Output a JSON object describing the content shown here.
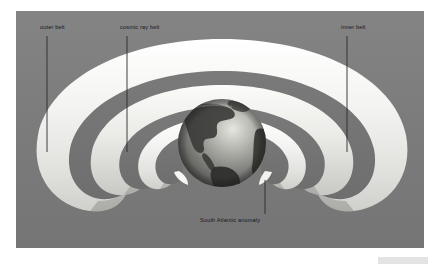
{
  "figure": {
    "type": "scientific-illustration",
    "style": "grayscale cross-section diagram",
    "background_color": "#7d7d7d",
    "page_color": "#ffffff",
    "frame": {
      "x": 16,
      "y": 11,
      "width": 408,
      "height": 237
    }
  },
  "labels": {
    "outer_belt": "outer belt",
    "cosmic_ray_belt": "cosmic ray belt",
    "inner_belt": "inner belt",
    "south_atlantic_anomaly": "South Atlantic anomaly"
  },
  "leader_lines": [
    {
      "name": "outer-belt-leader",
      "x": 47,
      "y_start": 36,
      "y_end": 152
    },
    {
      "name": "cosmic-ray-leader",
      "x": 127,
      "y_start": 36,
      "y_end": 152
    },
    {
      "name": "inner-belt-leader",
      "x": 347,
      "y_start": 36,
      "y_end": 152
    },
    {
      "name": "saa-leader",
      "x": 265,
      "y_start": 180,
      "y_end": 214
    }
  ],
  "belts": [
    {
      "name": "outer-belt",
      "shade": "#f2f2f0",
      "order": 1
    },
    {
      "name": "outer-belt-inner-face",
      "shade": "#d6d6d2",
      "order": 2
    },
    {
      "name": "cosmic-ray-belt",
      "shade": "#ececea",
      "order": 3
    },
    {
      "name": "cosmic-ray-belt-inner-face",
      "shade": "#c9c9c5",
      "order": 4
    },
    {
      "name": "inner-belt",
      "shade": "#f6f6f4",
      "order": 5
    },
    {
      "name": "inner-belt-inner-face",
      "shade": "#bdbdb9",
      "order": 6
    }
  ],
  "earth": {
    "name": "earth-globe",
    "center_x": 222,
    "center_y": 143,
    "radius": 44,
    "visible_hemisphere": "Americas",
    "ocean_color": "#9a9a96",
    "land_color": "#3f3f3d",
    "highlight_color": "#d8d8d2",
    "shadow_color": "#5a5a57"
  },
  "colors": {
    "background": "#7d7d7d",
    "belt_bright": "#f4f4f2",
    "belt_mid": "#d2d2ce",
    "belt_dark": "#b4b4b0",
    "label_text": "#16161a",
    "leader_line": "#2a2a2e",
    "caption_chip": "#e3e3e3"
  }
}
